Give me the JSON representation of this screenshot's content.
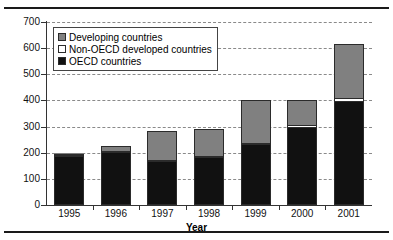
{
  "chart_data": {
    "type": "bar",
    "stacked": true,
    "title": "",
    "xlabel": "Year",
    "ylabel": "",
    "categories": [
      "1995",
      "1996",
      "1997",
      "1998",
      "1999",
      "2000",
      "2001"
    ],
    "ylim": [
      0,
      700
    ],
    "ytick_step": 100,
    "yticks": [
      "0",
      "100",
      "200",
      "300",
      "400",
      "500",
      "600",
      "700"
    ],
    "grid": "horizontal-dashed",
    "legend_position": "top-left-inside",
    "series": [
      {
        "name": "OECD countries",
        "color": "#111111",
        "values": [
          185,
          200,
          165,
          180,
          230,
          295,
          395
        ]
      },
      {
        "name": "Non-OECD developed countries",
        "color": "#ffffff",
        "values": [
          5,
          5,
          8,
          5,
          5,
          10,
          15
        ]
      },
      {
        "name": "Developing countries",
        "color": "#808080",
        "values": [
          5,
          20,
          110,
          105,
          165,
          95,
          205
        ]
      }
    ],
    "totals": [
      195,
      225,
      283,
      290,
      400,
      400,
      615
    ],
    "legend_order": [
      "Developing countries",
      "Non-OECD developed countries",
      "OECD countries"
    ]
  },
  "legend": {
    "items": [
      {
        "label": "Developing countries",
        "swatch": "legend-swatch-developing"
      },
      {
        "label": "Non-OECD developed countries",
        "swatch": "legend-swatch-non-oecd"
      },
      {
        "label": "OECD countries",
        "swatch": "legend-swatch-oecd"
      }
    ]
  },
  "axis": {
    "x_title": "Year"
  }
}
